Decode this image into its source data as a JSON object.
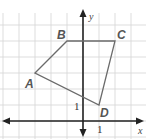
{
  "figure": {
    "type": "coordinate-plane-quadrilateral",
    "grid": {
      "unit_px": 16,
      "origin_px": [
        83,
        121
      ],
      "x_range": [
        -5,
        3
      ],
      "y_range": [
        -1,
        6
      ]
    },
    "axes": {
      "x_label": "x",
      "y_label": "y",
      "x_tick_label": "1",
      "y_tick_label": "1"
    },
    "vertices": [
      {
        "name": "A",
        "x": -3,
        "y": 3
      },
      {
        "name": "B",
        "x": -1,
        "y": 5
      },
      {
        "name": "C",
        "x": 2,
        "y": 5
      },
      {
        "name": "D",
        "x": 1,
        "y": 1
      }
    ],
    "colors": {
      "grid": "#d4d4d4",
      "axis": "#222222",
      "polygon": "#6b6b6b",
      "label": "#555555"
    }
  }
}
